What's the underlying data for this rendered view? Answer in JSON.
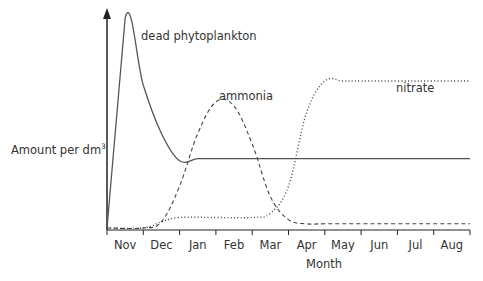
{
  "chart_data": {
    "type": "line",
    "title": "",
    "xlabel": "Month",
    "ylabel": "Amount per dm³",
    "ylabel_text": "Amount per dm",
    "ylabel_sup": "3",
    "categories": [
      "Nov",
      "Dec",
      "Jan",
      "Feb",
      "Mar",
      "Apr",
      "May",
      "Jun",
      "Jul",
      "Aug"
    ],
    "y_units": "relative (no numeric scale shown)",
    "ylim": [
      0,
      100
    ],
    "grid": false,
    "legend": "inline labels",
    "series": [
      {
        "name": "dead phytoplankton",
        "style": "solid",
        "points": [
          [
            0,
            0
          ],
          [
            0.5,
            100
          ],
          [
            1,
            68
          ],
          [
            1.5,
            45
          ],
          [
            2,
            32
          ],
          [
            2.5,
            33
          ],
          [
            3,
            33
          ],
          [
            4,
            33
          ],
          [
            5,
            33
          ],
          [
            6,
            33
          ],
          [
            7,
            33
          ],
          [
            8,
            33
          ],
          [
            9,
            33
          ],
          [
            10,
            33
          ]
        ]
      },
      {
        "name": "ammonia",
        "style": "dashed",
        "points": [
          [
            0,
            0
          ],
          [
            1,
            0
          ],
          [
            1.5,
            3
          ],
          [
            2,
            20
          ],
          [
            2.5,
            45
          ],
          [
            3,
            60
          ],
          [
            3.5,
            58
          ],
          [
            4,
            40
          ],
          [
            4.5,
            15
          ],
          [
            5,
            4
          ],
          [
            5.5,
            2
          ],
          [
            6,
            2
          ],
          [
            7,
            2
          ],
          [
            8,
            2
          ],
          [
            9,
            2
          ],
          [
            10,
            2
          ]
        ]
      },
      {
        "name": "nitrate",
        "style": "dotted",
        "points": [
          [
            0,
            0
          ],
          [
            1,
            0
          ],
          [
            1.5,
            3
          ],
          [
            2,
            5
          ],
          [
            3,
            5
          ],
          [
            4,
            5
          ],
          [
            4.5,
            7
          ],
          [
            5,
            20
          ],
          [
            5.5,
            55
          ],
          [
            6,
            70
          ],
          [
            6.5,
            70
          ],
          [
            7,
            70
          ],
          [
            8,
            70
          ],
          [
            9,
            70
          ],
          [
            10,
            70
          ]
        ]
      }
    ],
    "annotations": [
      "dead phytoplankton",
      "ammonia",
      "nitrate"
    ]
  }
}
